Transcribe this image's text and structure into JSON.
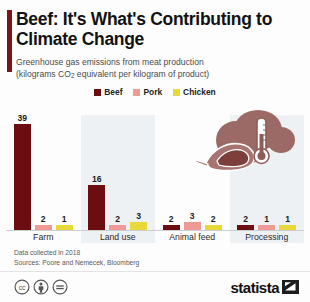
{
  "title": "Beef: It's What's Contributing to Climate Change",
  "subtitle_line1": "Greenhouse gas emissions from meat production",
  "subtitle_line2_pre": "(kilograms CO",
  "subtitle_line2_sub": "2",
  "subtitle_line2_post": " equivalent per kilogram of product)",
  "colors": {
    "beef": "#6b0d11",
    "pork": "#ef9a94",
    "chicken": "#e8d93a",
    "accent": "#7d1418",
    "panel": "#eef1f4",
    "illustration": "#9c6a66",
    "background": "#fdfdfd"
  },
  "legend": {
    "items": [
      {
        "label": "Beef",
        "color": "#6b0d11",
        "swatch_name": "legend-swatch-beef"
      },
      {
        "label": "Pork",
        "color": "#ef9a94",
        "swatch_name": "legend-swatch-pork"
      },
      {
        "label": "Chicken",
        "color": "#e8d93a",
        "swatch_name": "legend-swatch-chicken"
      }
    ]
  },
  "footer": {
    "data_collected": "Data collected in 2018",
    "sources": "Sources: Poore and Nemecek, Bloomberg",
    "cc_badges": [
      {
        "name": "creative-commons-icon",
        "glyph": "cc"
      },
      {
        "name": "cc-by-attribution-icon",
        "glyph": "by"
      },
      {
        "name": "cc-nd-noderivatives-icon",
        "glyph": "nd"
      }
    ],
    "brand_name": "statista"
  },
  "illustration": {
    "name": "steak-and-thermometer-illustration",
    "alt": "steak with thermometer and emission clouds"
  },
  "chart_data": {
    "type": "bar",
    "title": "Beef: It's What's Contributing to Climate Change",
    "subtitle": "Greenhouse gas emissions from meat production (kilograms CO2 equivalent per kilogram of product)",
    "xlabel": "",
    "ylabel": "kg CO2 equivalent per kg of product",
    "ylim": [
      0,
      39
    ],
    "grid": false,
    "legend_position": "top-center",
    "categories": [
      "Farm",
      "Land use",
      "Animal feed",
      "Processing"
    ],
    "series": [
      {
        "name": "Beef",
        "color": "#6b0d11",
        "values": [
          39,
          16,
          2,
          2
        ]
      },
      {
        "name": "Pork",
        "color": "#ef9a94",
        "values": [
          2,
          2,
          3,
          1
        ]
      },
      {
        "name": "Chicken",
        "color": "#e8d93a",
        "values": [
          1,
          3,
          2,
          1
        ]
      }
    ],
    "groups": [
      {
        "label": "Farm",
        "shaded": false,
        "bars": [
          {
            "series": "Beef",
            "value": 39,
            "color": "#6b0d11"
          },
          {
            "series": "Pork",
            "value": 2,
            "color": "#ef9a94"
          },
          {
            "series": "Chicken",
            "value": 1,
            "color": "#e8d93a"
          }
        ]
      },
      {
        "label": "Land use",
        "shaded": true,
        "bars": [
          {
            "series": "Beef",
            "value": 16,
            "color": "#6b0d11"
          },
          {
            "series": "Pork",
            "value": 2,
            "color": "#ef9a94"
          },
          {
            "series": "Chicken",
            "value": 3,
            "color": "#e8d93a"
          }
        ]
      },
      {
        "label": "Animal feed",
        "shaded": false,
        "bars": [
          {
            "series": "Beef",
            "value": 2,
            "color": "#6b0d11"
          },
          {
            "series": "Pork",
            "value": 3,
            "color": "#ef9a94"
          },
          {
            "series": "Chicken",
            "value": 2,
            "color": "#e8d93a"
          }
        ]
      },
      {
        "label": "Processing",
        "shaded": true,
        "bars": [
          {
            "series": "Beef",
            "value": 2,
            "color": "#6b0d11"
          },
          {
            "series": "Pork",
            "value": 1,
            "color": "#ef9a94"
          },
          {
            "series": "Chicken",
            "value": 1,
            "color": "#e8d93a"
          }
        ]
      }
    ]
  }
}
